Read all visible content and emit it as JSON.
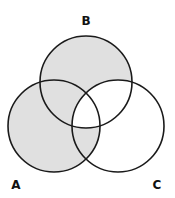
{
  "diagram": {
    "type": "venn",
    "sets": [
      {
        "id": "A",
        "label": "A",
        "cx": 54,
        "cy": 126,
        "r": 46
      },
      {
        "id": "B",
        "label": "B",
        "cx": 86,
        "cy": 82,
        "r": 46
      },
      {
        "id": "C",
        "label": "C",
        "cx": 118,
        "cy": 126,
        "r": 46
      }
    ],
    "labels": {
      "A": "A",
      "B": "B",
      "C": "C"
    },
    "shaded_regions": [
      "A only",
      "B only",
      "A∩B only",
      "A∩C only"
    ],
    "unshaded_regions": [
      "C only",
      "B∩C only",
      "A∩B∩C"
    ],
    "shaded_expression": "(A ∪ B) − (B ∩ C)",
    "colors": {
      "shade": "#e0e0e0",
      "stroke": "#1a1a1a",
      "background": "#ffffff"
    }
  }
}
